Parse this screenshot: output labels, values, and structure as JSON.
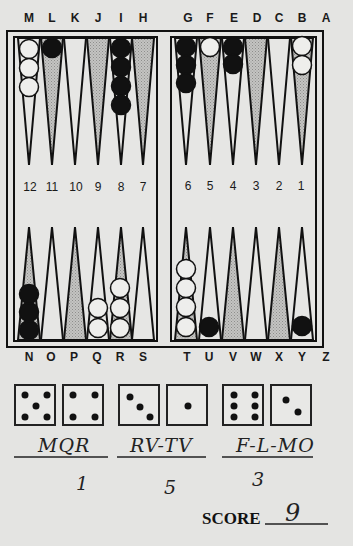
{
  "board": {
    "top_labels": [
      "M",
      "L",
      "K",
      "J",
      "I",
      "H",
      "G",
      "F",
      "E",
      "D",
      "C",
      "B",
      "A"
    ],
    "bottom_labels": [
      "N",
      "O",
      "P",
      "Q",
      "R",
      "S",
      "T",
      "U",
      "V",
      "W",
      "X",
      "Y",
      "Z"
    ],
    "point_numbers": [
      "12",
      "11",
      "10",
      "9",
      "8",
      "7",
      "6",
      "5",
      "4",
      "3",
      "2",
      "1"
    ],
    "colors": {
      "frame": "#111111",
      "board_bg": "#e6e6e4",
      "shaded_point": "#b8b8b6",
      "white_checker": "#eeeeec",
      "black_checker": "#111111"
    },
    "top_points": [
      {
        "label": "M",
        "shaded": false,
        "checkers": {
          "color": "white",
          "count": 3
        }
      },
      {
        "label": "L",
        "shaded": true,
        "checkers": {
          "color": "black",
          "count": 1
        }
      },
      {
        "label": "K",
        "shaded": false,
        "checkers": {
          "color": "none",
          "count": 0
        }
      },
      {
        "label": "J",
        "shaded": true,
        "checkers": {
          "color": "none",
          "count": 0
        }
      },
      {
        "label": "I",
        "shaded": false,
        "checkers": {
          "color": "black",
          "count": 4
        }
      },
      {
        "label": "H",
        "shaded": true,
        "checkers": {
          "color": "none",
          "count": 0
        }
      },
      {
        "label": "G",
        "shaded": false,
        "checkers": {
          "color": "black",
          "count": 3
        }
      },
      {
        "label": "F",
        "shaded": true,
        "checkers": {
          "color": "white",
          "count": 1
        }
      },
      {
        "label": "E",
        "shaded": false,
        "checkers": {
          "color": "black",
          "count": 2
        }
      },
      {
        "label": "D",
        "shaded": true,
        "checkers": {
          "color": "none",
          "count": 0
        }
      },
      {
        "label": "C",
        "shaded": false,
        "checkers": {
          "color": "none",
          "count": 0
        }
      },
      {
        "label": "B",
        "shaded": true,
        "checkers": {
          "color": "white",
          "count": 2
        }
      }
    ],
    "bottom_points": [
      {
        "label": "N",
        "shaded": true,
        "checkers": {
          "color": "black",
          "count": 3
        }
      },
      {
        "label": "O",
        "shaded": false,
        "checkers": {
          "color": "none",
          "count": 0
        }
      },
      {
        "label": "P",
        "shaded": true,
        "checkers": {
          "color": "none",
          "count": 0
        }
      },
      {
        "label": "Q",
        "shaded": false,
        "checkers": {
          "color": "white",
          "count": 2
        }
      },
      {
        "label": "R",
        "shaded": true,
        "checkers": {
          "color": "white",
          "count": 3
        }
      },
      {
        "label": "S",
        "shaded": false,
        "checkers": {
          "color": "none",
          "count": 0
        }
      },
      {
        "label": "T",
        "shaded": true,
        "checkers": {
          "color": "white",
          "count": 4
        }
      },
      {
        "label": "U",
        "shaded": false,
        "checkers": {
          "color": "black",
          "count": 1
        }
      },
      {
        "label": "V",
        "shaded": true,
        "checkers": {
          "color": "none",
          "count": 0
        }
      },
      {
        "label": "W",
        "shaded": false,
        "checkers": {
          "color": "none",
          "count": 0
        }
      },
      {
        "label": "X",
        "shaded": true,
        "checkers": {
          "color": "none",
          "count": 0
        }
      },
      {
        "label": "Y",
        "shaded": false,
        "checkers": {
          "color": "black",
          "count": 1
        }
      }
    ]
  },
  "dice_pairs": [
    {
      "dice": [
        5,
        4
      ],
      "move": "MQR",
      "value": "1"
    },
    {
      "dice": [
        3,
        1
      ],
      "move": "RV-TV",
      "value": "5"
    },
    {
      "dice": [
        6,
        2
      ],
      "move": "F-L-MO",
      "value": "3"
    }
  ],
  "score": {
    "label": "SCORE",
    "value": "9"
  }
}
